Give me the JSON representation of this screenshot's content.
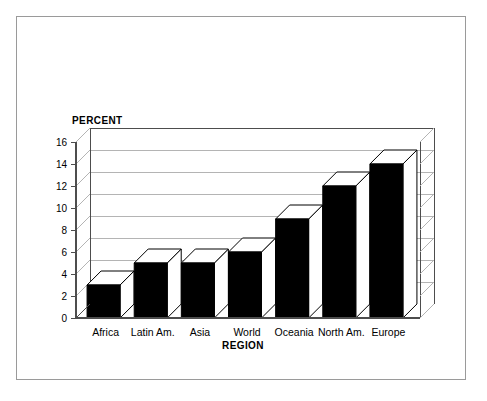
{
  "chart_data": {
    "type": "bar",
    "title": "",
    "subtitle": "",
    "xlabel": "REGION",
    "ylabel": "PERCENT",
    "categories": [
      "Africa",
      "Latin Am.",
      "Asia",
      "World",
      "Oceania",
      "North Am.",
      "Europe"
    ],
    "values": [
      3,
      5,
      5,
      6,
      9,
      12,
      14
    ],
    "ylim": [
      0,
      16
    ],
    "ytick_step": 2,
    "yticks": [
      "0",
      "2",
      "4",
      "6",
      "8",
      "10",
      "12",
      "14",
      "16"
    ],
    "grid": true,
    "grid_axis": "y",
    "legend": false,
    "legend_position": "none",
    "style": "3d-bar",
    "bar_face_color": "#000000",
    "bar_top_color": "#ffffff",
    "bar_side_color": "#ffffff",
    "bar_edge_color": "#000000",
    "grid_color": "#b4b4b4",
    "axis_color": "#4d4d4d",
    "frame_color": "#9a9a9a",
    "background_color": "#ffffff"
  }
}
